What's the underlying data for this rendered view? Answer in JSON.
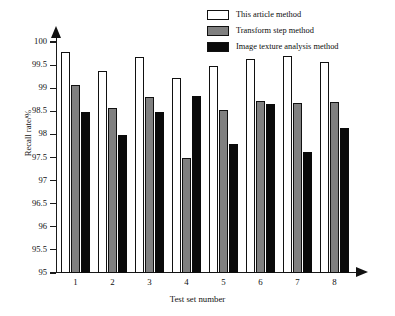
{
  "chart_data": {
    "type": "bar",
    "title": "",
    "xlabel": "Test set number",
    "ylabel": "Recall rate/%",
    "categories": [
      "1",
      "2",
      "3",
      "4",
      "5",
      "6",
      "7",
      "8"
    ],
    "ylim": [
      95,
      100
    ],
    "ytick_labels": [
      "95",
      "95.5",
      "96",
      "96.5",
      "97",
      "97.5",
      "98",
      "98.5",
      "99",
      "99.5",
      "100"
    ],
    "ytick_values": [
      95,
      95.5,
      96,
      96.5,
      97,
      97.5,
      98,
      98.5,
      99,
      99.5,
      100
    ],
    "grid": false,
    "legend_position": "top-right",
    "series": [
      {
        "name": "This article method",
        "color": "#ffffff",
        "edge_color": "#111111",
        "values": [
          99.79,
          99.38,
          99.67,
          99.23,
          99.49,
          99.64,
          99.69,
          99.56
        ]
      },
      {
        "name": "Transform step method",
        "color": "#808080",
        "edge_color": "#111111",
        "values": [
          99.07,
          98.57,
          98.82,
          97.49,
          98.53,
          98.73,
          98.69,
          98.71
        ]
      },
      {
        "name": "Image texture analysis method",
        "color": "#0a0a0a",
        "edge_color": "#0a0a0a",
        "values": [
          98.48,
          97.98,
          98.49,
          98.83,
          97.8,
          98.65,
          97.61,
          98.13
        ]
      }
    ]
  }
}
